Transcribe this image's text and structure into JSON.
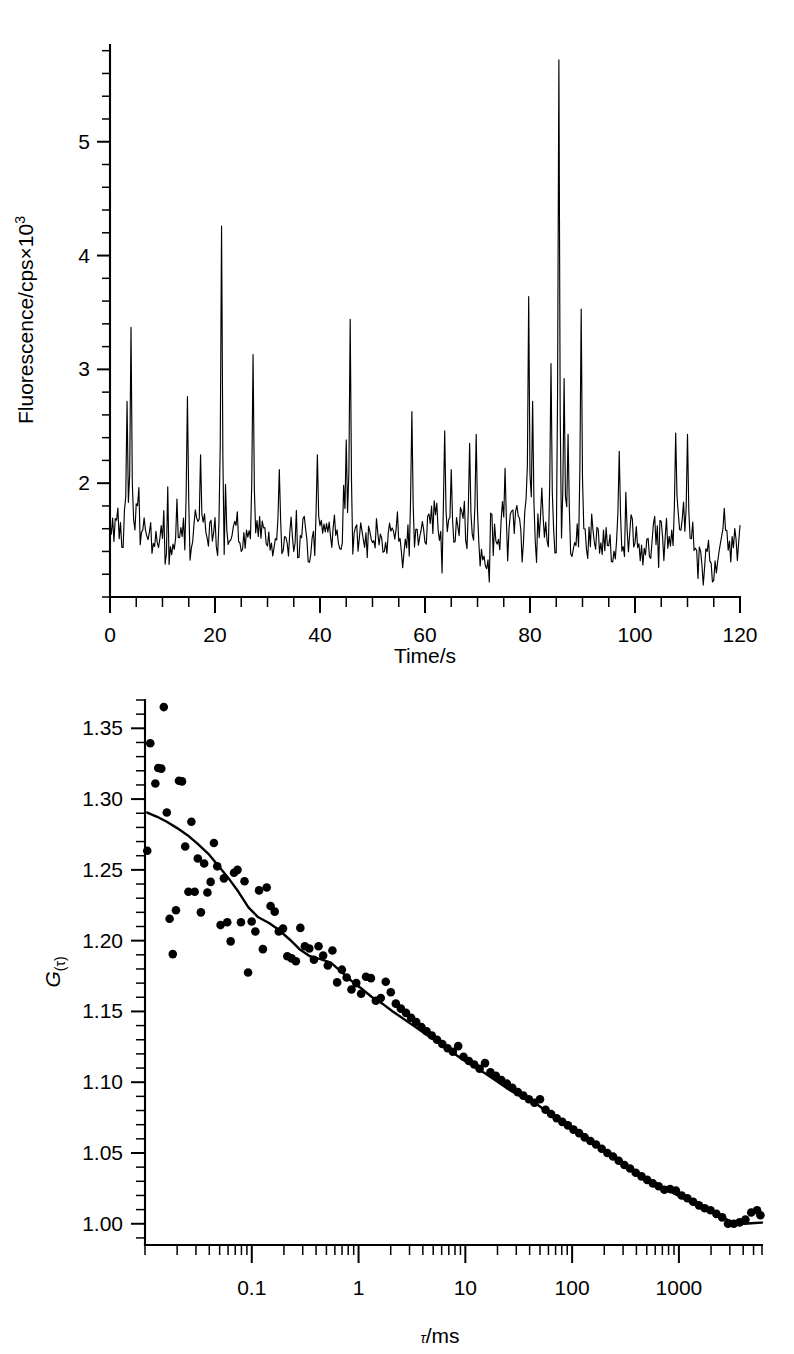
{
  "figure": {
    "background": "#ffffff",
    "ink": "#000000"
  },
  "chart_data": [
    {
      "id": "fluorescence-timetrace",
      "type": "line",
      "title": "",
      "xlabel": "Time/s",
      "ylabel": "Fluorescence/cps×10³",
      "ylabel_base": "Fluorescence/cps×10",
      "ylabel_exponent": "3",
      "xlim": [
        0,
        120
      ],
      "ylim": [
        1.0,
        5.85
      ],
      "xticks": [
        0,
        20,
        40,
        60,
        80,
        100,
        120
      ],
      "xticklabels": [
        "0",
        "20",
        "40",
        "60",
        "80",
        "100",
        "120"
      ],
      "yticks": [
        2,
        3,
        4,
        5
      ],
      "yticklabels": [
        "2",
        "3",
        "4",
        "5"
      ],
      "x_minor_interval": 5,
      "y_minor_interval": 0.2,
      "grid": false,
      "legend": null,
      "baseline_mean": 1.52,
      "noise_amplitude": 0.3,
      "x_step": 0.25,
      "peaks": [
        {
          "t": 4.0,
          "height": 3.37
        },
        {
          "t": 3.3,
          "height": 2.72
        },
        {
          "t": 14.8,
          "height": 2.76
        },
        {
          "t": 21.3,
          "height": 4.26
        },
        {
          "t": 27.2,
          "height": 3.13
        },
        {
          "t": 32.3,
          "height": 2.12
        },
        {
          "t": 39.6,
          "height": 2.25
        },
        {
          "t": 45.7,
          "height": 3.44
        },
        {
          "t": 45.0,
          "height": 2.38
        },
        {
          "t": 57.5,
          "height": 2.63
        },
        {
          "t": 63.8,
          "height": 2.46
        },
        {
          "t": 65.0,
          "height": 2.12
        },
        {
          "t": 68.5,
          "height": 2.35
        },
        {
          "t": 69.8,
          "height": 2.43
        },
        {
          "t": 75.2,
          "height": 2.13
        },
        {
          "t": 79.8,
          "height": 3.64
        },
        {
          "t": 80.6,
          "height": 2.72
        },
        {
          "t": 84.0,
          "height": 3.05
        },
        {
          "t": 85.6,
          "height": 5.72
        },
        {
          "t": 86.5,
          "height": 2.92
        },
        {
          "t": 87.2,
          "height": 2.43
        },
        {
          "t": 89.8,
          "height": 3.53
        },
        {
          "t": 97.0,
          "height": 2.28
        },
        {
          "t": 107.7,
          "height": 2.44
        },
        {
          "t": 109.9,
          "height": 2.43
        },
        {
          "t": 117.0,
          "height": 1.78
        }
      ]
    },
    {
      "id": "autocorrelation-curve",
      "type": "scatter",
      "title": "",
      "xlabel": "τ/ms",
      "ylabel": "G(τ)",
      "ylabel_base": "G",
      "ylabel_sub": "(τ)",
      "xscale": "log",
      "xlim": [
        0.01,
        6000
      ],
      "ylim": [
        0.985,
        1.37
      ],
      "xticks": [
        0.1,
        1,
        10,
        100,
        1000
      ],
      "xticklabels": [
        "0.1",
        "1",
        "10",
        "100",
        "1000"
      ],
      "yticks": [
        1.0,
        1.05,
        1.1,
        1.15,
        1.2,
        1.25,
        1.3,
        1.35
      ],
      "yticklabels": [
        "1.00",
        "1.05",
        "1.10",
        "1.15",
        "1.20",
        "1.25",
        "1.30",
        "1.35"
      ],
      "y_minor_interval": 0.01,
      "grid": false,
      "legend": null,
      "fit": {
        "name": "fitted model",
        "G0": 0.29,
        "baseline": 1.0,
        "points": [
          [
            0.0105,
            1.2905
          ],
          [
            0.013,
            1.2875
          ],
          [
            0.016,
            1.284
          ],
          [
            0.02,
            1.2795
          ],
          [
            0.025,
            1.2745
          ],
          [
            0.031,
            1.2685
          ],
          [
            0.039,
            1.2615
          ],
          [
            0.048,
            1.2535
          ],
          [
            0.06,
            1.2445
          ],
          [
            0.075,
            1.2345
          ],
          [
            0.093,
            1.2235
          ],
          [
            0.115,
            1.2165
          ],
          [
            0.145,
            1.2125
          ],
          [
            0.18,
            1.2075
          ],
          [
            0.225,
            1.201
          ],
          [
            0.28,
            1.194
          ],
          [
            0.35,
            1.189
          ],
          [
            0.44,
            1.187
          ],
          [
            0.55,
            1.1845
          ],
          [
            0.69,
            1.178
          ],
          [
            0.86,
            1.1715
          ],
          [
            1.07,
            1.166
          ],
          [
            1.34,
            1.16
          ],
          [
            1.67,
            1.1555
          ],
          [
            2.09,
            1.15
          ],
          [
            2.61,
            1.145
          ],
          [
            3.26,
            1.14
          ],
          [
            4.07,
            1.135
          ],
          [
            5.09,
            1.13
          ],
          [
            6.36,
            1.125
          ],
          [
            7.95,
            1.12
          ],
          [
            9.93,
            1.115
          ],
          [
            12.4,
            1.1105
          ],
          [
            15.5,
            1.106
          ],
          [
            19.4,
            1.101
          ],
          [
            24.2,
            1.096
          ],
          [
            30.3,
            1.0915
          ],
          [
            37.8,
            1.088
          ],
          [
            47.3,
            1.084
          ],
          [
            59.1,
            1.079
          ],
          [
            73.9,
            1.074
          ],
          [
            92.3,
            1.069
          ],
          [
            115,
            1.064
          ],
          [
            144,
            1.0595
          ],
          [
            180,
            1.0545
          ],
          [
            225,
            1.049
          ],
          [
            281,
            1.044
          ],
          [
            352,
            1.039
          ],
          [
            440,
            1.034
          ],
          [
            550,
            1.0295
          ],
          [
            687,
            1.0258
          ],
          [
            859,
            1.0222
          ],
          [
            1074,
            1.0185
          ],
          [
            1342,
            1.0145
          ],
          [
            1678,
            1.011
          ],
          [
            2097,
            1.0075
          ],
          [
            2621,
            1.004
          ],
          [
            3277,
            1.001
          ],
          [
            4096,
            1.0
          ],
          [
            5120,
            1.0005
          ],
          [
            6000,
            1.0008
          ]
        ]
      },
      "points": [
        [
          0.0105,
          1.2635
        ],
        [
          0.0112,
          1.3395
        ],
        [
          0.0125,
          1.311
        ],
        [
          0.0133,
          1.322
        ],
        [
          0.0142,
          1.3215
        ],
        [
          0.015,
          1.365
        ],
        [
          0.016,
          1.2905
        ],
        [
          0.017,
          1.2155
        ],
        [
          0.0182,
          1.1905
        ],
        [
          0.0195,
          1.2215
        ],
        [
          0.0208,
          1.313
        ],
        [
          0.0222,
          1.3125
        ],
        [
          0.0238,
          1.2665
        ],
        [
          0.0255,
          1.2345
        ],
        [
          0.0272,
          1.284
        ],
        [
          0.0292,
          1.2345
        ],
        [
          0.0312,
          1.258
        ],
        [
          0.0334,
          1.22
        ],
        [
          0.0358,
          1.2545
        ],
        [
          0.0384,
          1.234
        ],
        [
          0.0412,
          1.2415
        ],
        [
          0.0442,
          1.269
        ],
        [
          0.0475,
          1.2525
        ],
        [
          0.051,
          1.211
        ],
        [
          0.0548,
          1.244
        ],
        [
          0.0589,
          1.213
        ],
        [
          0.0634,
          1.1995
        ],
        [
          0.0682,
          1.248
        ],
        [
          0.0735,
          1.25
        ],
        [
          0.0792,
          1.213
        ],
        [
          0.0855,
          1.242
        ],
        [
          0.0923,
          1.1775
        ],
        [
          0.0998,
          1.2135
        ],
        [
          0.108,
          1.2065
        ],
        [
          0.117,
          1.2355
        ],
        [
          0.127,
          1.194
        ],
        [
          0.138,
          1.2375
        ],
        [
          0.15,
          1.2245
        ],
        [
          0.164,
          1.2205
        ],
        [
          0.179,
          1.2065
        ],
        [
          0.196,
          1.2085
        ],
        [
          0.215,
          1.189
        ],
        [
          0.236,
          1.1875
        ],
        [
          0.259,
          1.1855
        ],
        [
          0.285,
          1.209
        ],
        [
          0.314,
          1.196
        ],
        [
          0.346,
          1.1945
        ],
        [
          0.382,
          1.1865
        ],
        [
          0.422,
          1.196
        ],
        [
          0.466,
          1.1895
        ],
        [
          0.515,
          1.1825
        ],
        [
          0.569,
          1.193
        ],
        [
          0.63,
          1.1705
        ],
        [
          0.698,
          1.1795
        ],
        [
          0.774,
          1.174
        ],
        [
          0.858,
          1.1655
        ],
        [
          0.952,
          1.17
        ],
        [
          1.057,
          1.1625
        ],
        [
          1.174,
          1.1745
        ],
        [
          1.305,
          1.1735
        ],
        [
          1.451,
          1.1575
        ],
        [
          1.615,
          1.1595
        ],
        [
          1.798,
          1.171
        ],
        [
          2.003,
          1.1635
        ],
        [
          2.233,
          1.1555
        ],
        [
          2.49,
          1.152
        ],
        [
          2.779,
          1.149
        ],
        [
          3.103,
          1.1455
        ],
        [
          3.468,
          1.1425
        ],
        [
          3.877,
          1.139
        ],
        [
          4.337,
          1.136
        ],
        [
          4.853,
          1.133
        ],
        [
          5.434,
          1.13
        ],
        [
          6.086,
          1.127
        ],
        [
          6.819,
          1.124
        ],
        [
          7.642,
          1.1215
        ],
        [
          8.569,
          1.1255
        ],
        [
          9.612,
          1.118
        ],
        [
          10.79,
          1.115
        ],
        [
          12.11,
          1.1125
        ],
        [
          13.6,
          1.1095
        ],
        [
          15.28,
          1.1135
        ],
        [
          17.18,
          1.107
        ],
        [
          19.32,
          1.1045
        ],
        [
          21.74,
          1.1015
        ],
        [
          24.46,
          1.099
        ],
        [
          27.54,
          1.096
        ],
        [
          31.01,
          1.093
        ],
        [
          34.93,
          1.0905
        ],
        [
          39.36,
          1.088
        ],
        [
          44.36,
          1.0855
        ],
        [
          50.01,
          1.088
        ],
        [
          56.38,
          1.0805
        ],
        [
          63.58,
          1.0775
        ],
        [
          71.72,
          1.0745
        ],
        [
          80.91,
          1.072
        ],
        [
          91.3,
          1.0695
        ],
        [
          103.1,
          1.0665
        ],
        [
          116.4,
          1.064
        ],
        [
          131.4,
          1.061
        ],
        [
          148.4,
          1.0585
        ],
        [
          167.6,
          1.056
        ],
        [
          189.3,
          1.053
        ],
        [
          213.8,
          1.05
        ],
        [
          241.6,
          1.0475
        ],
        [
          273.1,
          1.0445
        ],
        [
          308.7,
          1.0415
        ],
        [
          349.0,
          1.039
        ],
        [
          394.6,
          1.036
        ],
        [
          446.3,
          1.0335
        ],
        [
          504.8,
          1.031
        ],
        [
          571.1,
          1.0285
        ],
        [
          646.1,
          1.0265
        ],
        [
          731.1,
          1.024
        ],
        [
          827.4,
          1.0245
        ],
        [
          936.8,
          1.0235
        ],
        [
          1061,
          1.02
        ],
        [
          1201,
          1.018
        ],
        [
          1360,
          1.0155
        ],
        [
          1541,
          1.013
        ],
        [
          1746,
          1.011
        ],
        [
          1979,
          1.0095
        ],
        [
          2243,
          1.007
        ],
        [
          2542,
          1.0045
        ],
        [
          2881,
          1.0
        ],
        [
          3266,
          1.0
        ],
        [
          3702,
          1.001
        ],
        [
          4196,
          1.003
        ],
        [
          4757,
          1.008
        ],
        [
          5392,
          1.0095
        ],
        [
          5800,
          1.006
        ]
      ]
    }
  ]
}
